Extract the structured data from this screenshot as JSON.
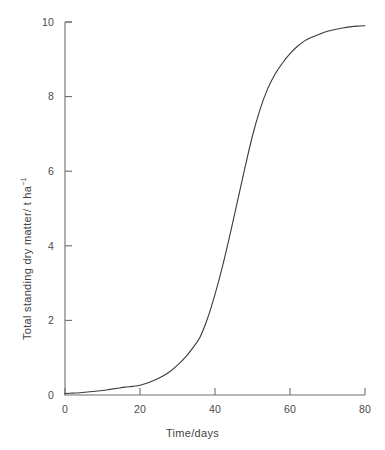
{
  "chart_data": {
    "type": "line",
    "title": "",
    "subtitle": "",
    "xlabel": "Time/days",
    "ylabel_prefix": "Total standing dry matter/ t ha",
    "ylabel_exponent": "−1",
    "ylabel_full": "Total standing dry matter/ t ha−1",
    "xlim": [
      0,
      80
    ],
    "ylim": [
      0,
      10
    ],
    "xticks": [
      "0",
      "20",
      "40",
      "60",
      "80"
    ],
    "xtick_values": [
      0,
      20,
      40,
      60,
      80
    ],
    "yticks": [
      "0",
      "2",
      "4",
      "6",
      "8",
      "10"
    ],
    "ytick_values": [
      0,
      2,
      4,
      6,
      8,
      10
    ],
    "grid": false,
    "legend": "none",
    "line_color": "#3b3b3b",
    "line_width": 1.1,
    "axis_color": "#6e6e6e",
    "background_color": "#ffffff",
    "series": [
      {
        "name": "Total standing dry matter",
        "x": [
          0,
          2,
          4,
          6,
          8,
          10,
          12,
          14,
          16,
          18,
          20,
          22,
          24,
          26,
          28,
          30,
          32,
          34,
          36,
          38,
          40,
          42,
          44,
          46,
          48,
          50,
          52,
          54,
          56,
          58,
          60,
          62,
          64,
          66,
          68,
          70,
          72,
          74,
          76,
          78,
          80
        ],
        "y": [
          0.04,
          0.05,
          0.06,
          0.08,
          0.1,
          0.12,
          0.15,
          0.18,
          0.21,
          0.23,
          0.26,
          0.32,
          0.4,
          0.5,
          0.63,
          0.8,
          1.0,
          1.25,
          1.55,
          2.05,
          2.7,
          3.45,
          4.3,
          5.2,
          6.1,
          6.95,
          7.65,
          8.2,
          8.6,
          8.9,
          9.15,
          9.35,
          9.5,
          9.6,
          9.68,
          9.75,
          9.8,
          9.84,
          9.87,
          9.89,
          9.9
        ]
      }
    ]
  }
}
